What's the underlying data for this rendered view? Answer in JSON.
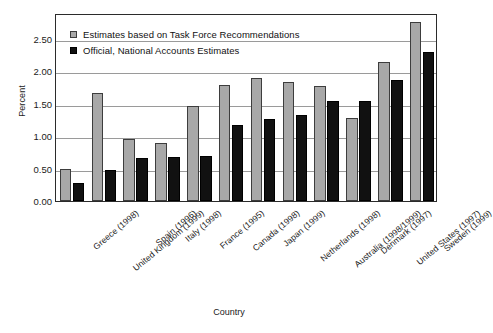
{
  "chart_data": {
    "type": "bar",
    "title": "",
    "xlabel": "Country",
    "ylabel": "Percent",
    "ylim": [
      0.0,
      2.9
    ],
    "yticks": [
      "0.00",
      "0.50",
      "1.00",
      "1.50",
      "2.00",
      "2.50"
    ],
    "ytick_values": [
      0.0,
      0.5,
      1.0,
      1.5,
      2.0,
      2.5
    ],
    "grid": true,
    "legend_position": "top-left",
    "categories": [
      "Greece (1998)",
      "United Kingdom (1999)",
      "Spain (1996)",
      "Italy (1998)",
      "France (1995)",
      "Canada (1998)",
      "Japan (1999)",
      "Netherlands (1998)",
      "Australia (1998/1999)",
      "Denmark (1997)",
      "United States (1997)",
      "Sweden (1999)"
    ],
    "series": [
      {
        "name": "Estimates based on Task Force Recommendations",
        "color": "#a8a8a8",
        "values": [
          0.49,
          1.67,
          0.95,
          0.89,
          1.46,
          1.79,
          1.9,
          1.84,
          1.77,
          1.28,
          2.15,
          2.76
        ]
      },
      {
        "name": "Official, National Accounts Estimates",
        "color": "#111111",
        "values": [
          0.28,
          0.48,
          0.66,
          0.68,
          0.7,
          1.18,
          1.27,
          1.33,
          1.54,
          1.55,
          1.87,
          2.3
        ]
      }
    ]
  }
}
